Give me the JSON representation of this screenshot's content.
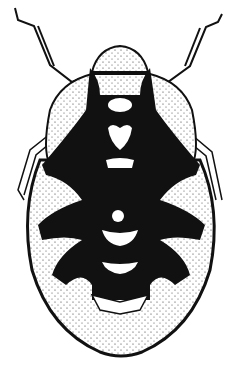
{
  "figure": {
    "style": "black ink stipple drawing",
    "colors": {
      "ink": "#111111",
      "paper": "#ffffff",
      "stipple": "#333333"
    },
    "parts": [
      "antennae",
      "head",
      "pronotum",
      "wing-pads",
      "legs",
      "abdomen-segments",
      "abdomen-tip"
    ]
  }
}
